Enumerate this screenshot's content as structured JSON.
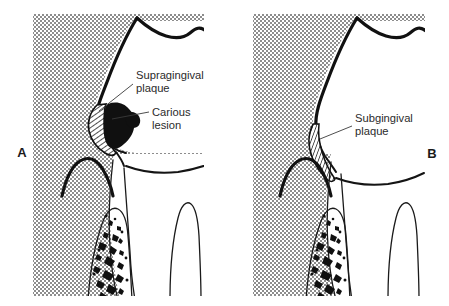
{
  "figure": {
    "background_color": "#ffffff",
    "stipple_color": "#9a9a9a",
    "ink_color": "#111111"
  },
  "panels": [
    {
      "id": "panel-a",
      "letter": "A",
      "letter_x": 22,
      "letter_y": 157,
      "stipple": {
        "x": 33,
        "y": 14,
        "width": 171,
        "height": 282
      },
      "callouts": [
        {
          "name": "supragingival-plaque",
          "line1": "Supragingival",
          "line2": "plaque",
          "text_x": 136,
          "text_y": 79,
          "line2_y": 92,
          "leader": "M133,84 L99,111"
        },
        {
          "name": "carious-lesion",
          "line1": "Carious",
          "line2": "lesion",
          "text_x": 152,
          "text_y": 116,
          "line2_y": 129,
          "leader": "M149,112 L112,119"
        }
      ]
    },
    {
      "id": "panel-b",
      "letter": "B",
      "letter_x": 432,
      "letter_y": 158,
      "stipple": {
        "x": 253,
        "y": 14,
        "width": 172,
        "height": 282
      },
      "callouts": [
        {
          "name": "subgingival-plaque",
          "line1": "Subgingival",
          "line2": "plaque",
          "text_x": 355,
          "text_y": 122,
          "line2_y": 135,
          "leader": "M352,126 L320,139"
        }
      ]
    }
  ],
  "legend_terms": [
    "Supragingival plaque",
    "Carious lesion",
    "Subgingival plaque"
  ]
}
